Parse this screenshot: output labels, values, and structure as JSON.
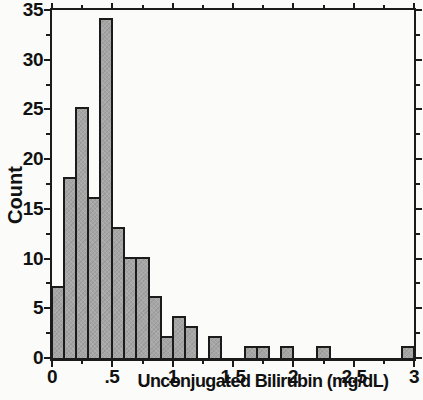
{
  "figure": {
    "background": "#fbfbfa",
    "frame_color": "#1b1b1b",
    "bar_fill": "#a6a6a6",
    "bar_border": "#1b1b1b",
    "text_color": "#111111"
  },
  "chart_data": {
    "type": "bar",
    "subtype": "histogram",
    "title": "",
    "xlabel": "Unconjugated Bilirubin (mg/dL)",
    "ylabel": "Count",
    "xlim": [
      0,
      3
    ],
    "ylim": [
      0,
      35
    ],
    "bin_start": 0,
    "bin_width": 0.1,
    "counts": [
      7,
      18,
      25,
      16,
      34,
      13,
      10,
      10,
      6,
      2,
      4,
      3,
      0,
      2,
      0,
      0,
      1,
      1,
      0,
      1,
      0,
      0,
      1,
      0,
      0,
      0,
      0,
      0,
      0,
      1
    ],
    "x_major_ticks": [
      0,
      0.5,
      1,
      1.5,
      2,
      2.5,
      3
    ],
    "x_tick_labels": [
      "0",
      ".5",
      "1",
      "1.5",
      "2",
      "2.5",
      "3"
    ],
    "x_minor_ticks": [
      0.25,
      0.75,
      1.25,
      1.75,
      2.25,
      2.75
    ],
    "y_major_ticks": [
      0,
      5,
      10,
      15,
      20,
      25,
      30,
      35
    ],
    "y_tick_labels": [
      "0",
      "5",
      "10",
      "15",
      "20",
      "25",
      "30",
      "35"
    ],
    "y_minor_ticks": [
      2.5,
      7.5,
      12.5,
      17.5,
      22.5,
      27.5,
      32.5
    ],
    "grid": false,
    "legend": null,
    "ticks_on_all_sides": true
  }
}
